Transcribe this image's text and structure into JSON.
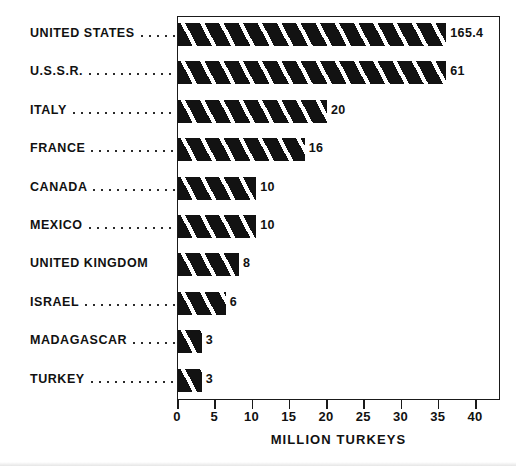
{
  "chart_data": {
    "type": "bar",
    "orientation": "horizontal",
    "title": "",
    "subtitle": "",
    "xlabel": "MILLION TURKEYS",
    "ylabel": "",
    "xlim": [
      0,
      40
    ],
    "xticks": [
      0,
      5,
      10,
      15,
      20,
      25,
      30,
      35,
      40
    ],
    "xtick_labels": [
      "0",
      "5",
      "10",
      "15",
      "20",
      "25",
      "30",
      "35",
      "40"
    ],
    "grid": false,
    "legend": false,
    "units": "million turkeys",
    "note": "Bars for United States (165.4) and U.S.S.R. (61) exceed the axis maximum and are drawn truncated at the plot edge.",
    "categories": [
      "UNITED STATES",
      "U.S.S.R.",
      "ITALY",
      "FRANCE",
      "CANADA",
      "MEXICO",
      "UNITED KINGDOM",
      "ISRAEL",
      "MADAGASCAR",
      "TURKEY"
    ],
    "values": [
      165.4,
      61,
      20,
      16,
      10,
      10,
      8,
      6,
      3,
      3
    ],
    "value_labels": [
      "165.4",
      "61",
      "20",
      "16",
      "10",
      "10",
      "8",
      "6",
      "3",
      "3"
    ],
    "drawn_lengths": [
      36.0,
      36.0,
      20.0,
      17.0,
      10.5,
      10.5,
      8.2,
      6.4,
      3.2,
      3.2
    ],
    "truncated": [
      true,
      true,
      false,
      false,
      false,
      false,
      false,
      false,
      false,
      false
    ],
    "colors": {
      "bar_fill": "#121212",
      "bar_hatch_gap": "#ffffff",
      "axis": "#1a1a1a",
      "text": "#111111",
      "background": "#ffffff"
    },
    "leader_dots": [
      true,
      true,
      true,
      true,
      true,
      true,
      false,
      true,
      true,
      true
    ]
  }
}
